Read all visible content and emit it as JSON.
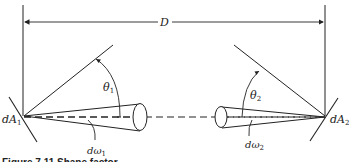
{
  "diagram": {
    "dimension_label": "D",
    "surface_1": {
      "label": "dA",
      "subscript": "1"
    },
    "surface_2": {
      "label": "dA",
      "subscript": "2"
    },
    "angle_1": {
      "label": "θ",
      "subscript": "1"
    },
    "angle_2": {
      "label": "θ",
      "subscript": "2"
    },
    "solid_angle_1": {
      "label": "dω",
      "subscript": "1"
    },
    "solid_angle_2": {
      "label": "dω",
      "subscript": "2"
    },
    "caption": "Figure 7.11   Shape factor"
  },
  "colors": {
    "line": "#222222",
    "background": "#ffffff"
  }
}
